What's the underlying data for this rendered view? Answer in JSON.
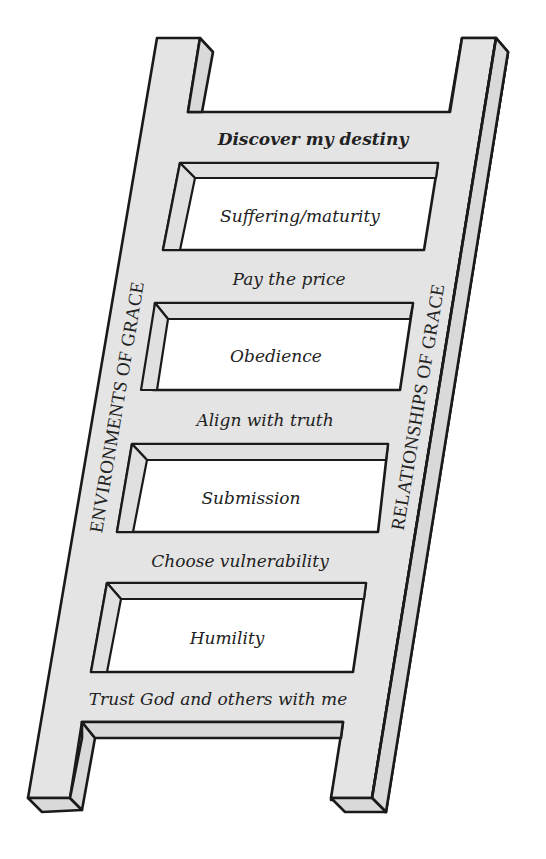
{
  "diagram": {
    "type": "ladder",
    "colors": {
      "frame": "#e4e4e4",
      "outline": "#1a1a1a",
      "hole": "#ffffff",
      "text": "#222222"
    },
    "side_labels": {
      "left": "ENVIRONMENTS OF GRACE",
      "right": "RELATIONSHIPS OF GRACE"
    },
    "top_label": "Discover my destiny",
    "steps": [
      {
        "hole_label": "Suffering/maturity",
        "rung_below": "Pay the price"
      },
      {
        "hole_label": "Obedience",
        "rung_below": "Align with truth"
      },
      {
        "hole_label": "Submission",
        "rung_below": "Choose vulnerability"
      },
      {
        "hole_label": "Humility",
        "rung_below": "Trust God and others with me"
      }
    ]
  }
}
